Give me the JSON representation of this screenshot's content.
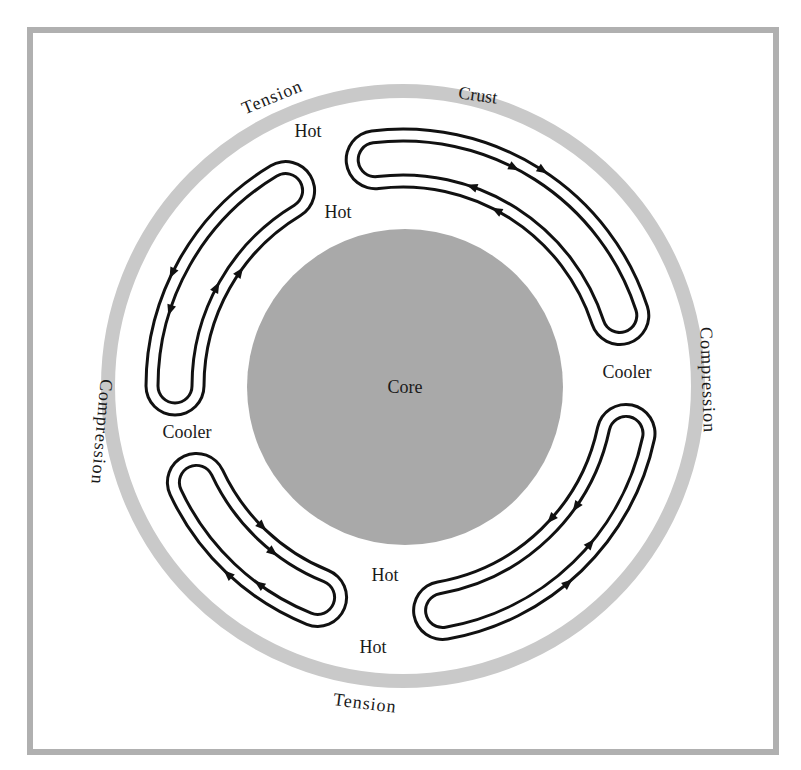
{
  "diagram": {
    "center": [
      403,
      386
    ],
    "frame": {
      "x": 30,
      "y": 30,
      "w": 746,
      "h": 722,
      "stroke": "#b0b0b0",
      "stroke_width": 6
    },
    "crust_ring": {
      "r": 295,
      "width": 14,
      "color": "#c9c9c9"
    },
    "core": {
      "r": 158,
      "color": "#a9a9a9"
    },
    "cell_style": {
      "line_color": "#111111",
      "radius": 228,
      "outer_half": 29,
      "inner_half": 17,
      "line_width": 3
    },
    "cells": [
      {
        "name": "top-left",
        "start": -180,
        "end": -121,
        "outer_flow": "ccw",
        "arrows": {
          "outer": [
            -162,
            -154
          ],
          "inner": [
            -152,
            -145
          ]
        }
      },
      {
        "name": "top-right",
        "start": -97,
        "end": -18,
        "outer_flow": "cw",
        "arrows": {
          "outer": [
            -63,
            -57
          ],
          "inner": [
            -71,
            -62
          ]
        }
      },
      {
        "name": "bottom-right",
        "start": 12,
        "end": 80,
        "outer_flow": "ccw",
        "arrows": {
          "outer": [
            40,
            50
          ],
          "inner": [
            35,
            42
          ]
        }
      },
      {
        "name": "bottom-left",
        "start": 112,
        "end": 155,
        "outer_flow": "cw",
        "arrows": {
          "outer": [
            126,
            133
          ],
          "inner": [
            128,
            135
          ]
        }
      }
    ]
  },
  "labels": {
    "core": "Core",
    "crust": "Crust",
    "tension_top": "Tension",
    "tension_bottom": "Tension",
    "compression_left": "Compression",
    "compression_right": "Compression",
    "hot_top_1": "Hot",
    "hot_top_2": "Hot",
    "hot_bottom_1": "Hot",
    "hot_bottom_2": "Hot",
    "cooler_left": "Cooler",
    "cooler_right": "Cooler"
  }
}
